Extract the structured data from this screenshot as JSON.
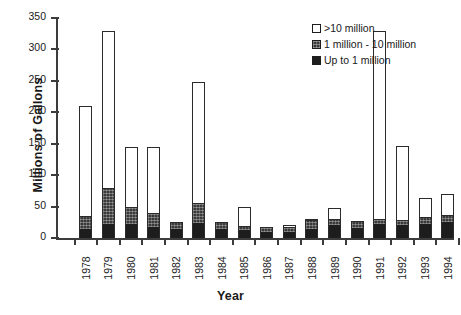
{
  "chart_data": {
    "type": "bar",
    "stacked": true,
    "title": "",
    "xlabel": "Year",
    "ylabel": "Millions of Gallons",
    "ylim": [
      0,
      350
    ],
    "ytick_step": 50,
    "yticks": [
      0,
      50,
      100,
      150,
      200,
      250,
      300,
      350
    ],
    "grid": false,
    "legend_position": "top-right",
    "categories": [
      "1978",
      "1979",
      "1980",
      "1981",
      "1982",
      "1983",
      "1984",
      "1985",
      "1986",
      "1987",
      "1988",
      "1989",
      "1990",
      "1991",
      "1992",
      "1993",
      "1994"
    ],
    "series": [
      {
        "name": "Up to 1 million",
        "color": "#1d1d1d",
        "values": [
          14,
          23,
          22,
          18,
          14,
          24,
          15,
          12,
          10,
          9,
          15,
          20,
          16,
          22,
          20,
          22,
          26
        ]
      },
      {
        "name": "1 million - 10 million",
        "color": "#3a3a3a",
        "values": [
          21,
          57,
          28,
          22,
          11,
          31,
          11,
          7,
          7,
          8,
          14,
          11,
          11,
          9,
          9,
          12,
          11
        ]
      },
      {
        "name": ">10 million",
        "color": "#ffffff",
        "values": [
          175,
          250,
          95,
          105,
          0,
          193,
          0,
          30,
          0,
          4,
          1,
          17,
          0,
          299,
          118,
          29,
          33
        ]
      }
    ],
    "totals": [
      210,
      330,
      145,
      145,
      25,
      248,
      26,
      49,
      17,
      21,
      30,
      48,
      27,
      330,
      147,
      63,
      70
    ]
  },
  "legend": {
    "items": [
      {
        "label": ">10 million",
        "swatch": "white-square-icon"
      },
      {
        "label": "1 million - 10 million",
        "swatch": "hatched-square-icon"
      },
      {
        "label": "Up to 1 million",
        "swatch": "black-square-icon"
      }
    ]
  }
}
